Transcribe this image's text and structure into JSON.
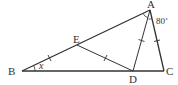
{
  "diagram": {
    "type": "geometry-triangle",
    "labels": {
      "A": "A",
      "B": "B",
      "C": "C",
      "D": "D",
      "E": "E"
    },
    "angle_A_label": "80˚",
    "angle_B_label": "x",
    "points": {
      "A": [
        150,
        10
      ],
      "B": [
        22,
        71
      ],
      "C": [
        164,
        71
      ],
      "D": [
        133,
        71
      ],
      "E": [
        77,
        45
      ]
    },
    "segments": [
      "AB",
      "BC",
      "AC",
      "AD",
      "ED"
    ],
    "equal_marks": [
      "BE",
      "ED",
      "AD",
      "AC"
    ],
    "colors": {
      "stroke": "#333333",
      "background": "#ffffff"
    }
  }
}
